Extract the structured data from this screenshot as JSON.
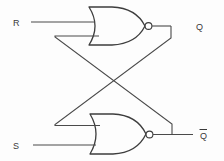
{
  "diagram": {
    "type": "logic-schematic",
    "background_color": "#fdfdfd",
    "line_color": "#4a4a4a",
    "labels": {
      "input_r": "R",
      "input_s": "S",
      "output_q": "Q",
      "output_q_not": "Q"
    },
    "gates": [
      {
        "id": "nor-top",
        "type": "NOR",
        "inputs": [
          "R",
          "Q_not_feedback"
        ],
        "output": "Q",
        "inverting_bubble": true
      },
      {
        "id": "nor-bottom",
        "type": "NOR",
        "inputs": [
          "Q_feedback",
          "S"
        ],
        "output": "Q_not",
        "inverting_bubble": true
      }
    ],
    "nets": [
      {
        "name": "R-input-wire",
        "from": "R",
        "to": "nor-top.in1"
      },
      {
        "name": "S-input-wire",
        "from": "S",
        "to": "nor-bottom.in2"
      },
      {
        "name": "Q-output-wire",
        "from": "nor-top.out",
        "to": "Q"
      },
      {
        "name": "Qnot-output-wire",
        "from": "nor-bottom.out",
        "to": "Q_not"
      },
      {
        "name": "feedback-top-to-bottom",
        "from": "nor-top.out",
        "to": "nor-bottom.in1",
        "crossed": true
      },
      {
        "name": "feedback-bottom-to-top",
        "from": "nor-bottom.out",
        "to": "nor-top.in2",
        "crossed": true
      }
    ]
  }
}
